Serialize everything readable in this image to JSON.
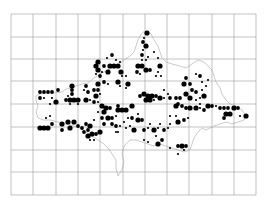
{
  "map": {
    "width": 266,
    "height": 211,
    "grid": {
      "x_lines": [
        11,
        33,
        56,
        78,
        100,
        123,
        145,
        167,
        189,
        212,
        234,
        256
      ],
      "y_lines": [
        14,
        37,
        59,
        81,
        104,
        127,
        150,
        172,
        195
      ],
      "color": "#9a9a9a"
    },
    "outline_color": "#a8a8a8",
    "dot_color": "#000000",
    "dot_sizes": {
      "L": 2.6,
      "M": 1.9,
      "S": 1.1
    },
    "outline_path": "M36,96 L40,94 L46,93 L54,93 L62,92 L66,89 L72,88 L76,86 L82,84 L88,83 L94,78 L100,74 L104,72 L108,70 L112,68 L118,65 L124,60 L130,56 L134,52 L136,46 L138,40 L140,36 L143,32 L147,31 L151,34 L154,40 L158,46 L160,52 L162,58 L166,62 L172,64 L180,66 L186,68 L192,64 L198,60 L204,62 L208,66 L212,70 L214,76 L216,82 L220,88 L222,94 L226,100 L230,104 L236,106 L242,110 L246,116 L244,120 L238,122 L232,124 L226,122 L220,124 L214,126 L210,128 L206,130 L202,128 L198,132 L194,138 L192,144 L190,150 L184,152 L178,150 L172,148 L166,146 L160,144 L154,146 L148,144 L142,142 L136,140 L130,140 L124,146 L122,154 L124,162 L122,170 L118,176 L116,168 L116,160 L112,154 L108,148 L104,144 L98,140 L92,136 L86,132 L80,128 L74,126 L66,124 L58,122 L50,120 L44,120 L38,118 L36,112 L38,106 L36,100 Z",
    "dots": [
      [
        147,
        33,
        "L"
      ],
      [
        144,
        38,
        "S"
      ],
      [
        143,
        42,
        "M"
      ],
      [
        146,
        46,
        "L"
      ],
      [
        143,
        50,
        "S"
      ],
      [
        154,
        52,
        "S"
      ],
      [
        142,
        55,
        "M"
      ],
      [
        142,
        60,
        "S"
      ],
      [
        146,
        60,
        "S"
      ],
      [
        148,
        57,
        "S"
      ],
      [
        158,
        58,
        "S"
      ],
      [
        138,
        66,
        "L"
      ],
      [
        142,
        66,
        "L"
      ],
      [
        146,
        70,
        "L"
      ],
      [
        150,
        70,
        "M"
      ],
      [
        137,
        72,
        "M"
      ],
      [
        140,
        74,
        "S"
      ],
      [
        160,
        66,
        "L"
      ],
      [
        158,
        72,
        "S"
      ],
      [
        156,
        76,
        "S"
      ],
      [
        161,
        76,
        "S"
      ],
      [
        98,
        62,
        "L"
      ],
      [
        96,
        66,
        "L"
      ],
      [
        104,
        66,
        "M"
      ],
      [
        110,
        66,
        "L"
      ],
      [
        114,
        66,
        "L"
      ],
      [
        118,
        66,
        "L"
      ],
      [
        108,
        72,
        "L"
      ],
      [
        98,
        70,
        "L"
      ],
      [
        102,
        72,
        "S"
      ],
      [
        100,
        76,
        "M"
      ],
      [
        96,
        74,
        "S"
      ],
      [
        112,
        55,
        "M"
      ],
      [
        107,
        58,
        "S"
      ],
      [
        116,
        60,
        "S"
      ],
      [
        120,
        62,
        "S"
      ],
      [
        121,
        72,
        "L"
      ],
      [
        122,
        76,
        "S"
      ],
      [
        126,
        76,
        "S"
      ],
      [
        40,
        92,
        "M"
      ],
      [
        44,
        92,
        "M"
      ],
      [
        48,
        92,
        "M"
      ],
      [
        52,
        92,
        "M"
      ],
      [
        58,
        90,
        "M"
      ],
      [
        40,
        98,
        "M"
      ],
      [
        44,
        98,
        "S"
      ],
      [
        52,
        98,
        "S"
      ],
      [
        56,
        102,
        "L"
      ],
      [
        50,
        104,
        "S"
      ],
      [
        72,
        86,
        "L"
      ],
      [
        72,
        90,
        "M"
      ],
      [
        72,
        94,
        "M"
      ],
      [
        68,
        96,
        "S"
      ],
      [
        66,
        100,
        "M"
      ],
      [
        70,
        100,
        "L"
      ],
      [
        74,
        100,
        "L"
      ],
      [
        78,
        100,
        "L"
      ],
      [
        70,
        104,
        "S"
      ],
      [
        78,
        104,
        "S"
      ],
      [
        86,
        86,
        "M"
      ],
      [
        84,
        90,
        "S"
      ],
      [
        88,
        92,
        "M"
      ],
      [
        94,
        90,
        "M"
      ],
      [
        98,
        90,
        "M"
      ],
      [
        98,
        84,
        "L"
      ],
      [
        96,
        96,
        "L"
      ],
      [
        100,
        94,
        "S"
      ],
      [
        86,
        100,
        "L"
      ],
      [
        90,
        100,
        "S"
      ],
      [
        94,
        102,
        "M"
      ],
      [
        98,
        102,
        "S"
      ],
      [
        104,
        82,
        "M"
      ],
      [
        108,
        84,
        "S"
      ],
      [
        118,
        82,
        "L"
      ],
      [
        120,
        86,
        "S"
      ],
      [
        128,
        84,
        "L"
      ],
      [
        126,
        88,
        "S"
      ],
      [
        144,
        94,
        "L"
      ],
      [
        148,
        96,
        "L"
      ],
      [
        152,
        96,
        "L"
      ],
      [
        156,
        96,
        "M"
      ],
      [
        140,
        96,
        "M"
      ],
      [
        146,
        100,
        "L"
      ],
      [
        150,
        100,
        "L"
      ],
      [
        154,
        100,
        "S"
      ],
      [
        160,
        98,
        "L"
      ],
      [
        164,
        98,
        "S"
      ],
      [
        164,
        90,
        "S"
      ],
      [
        168,
        94,
        "S"
      ],
      [
        170,
        98,
        "M"
      ],
      [
        176,
        98,
        "M"
      ],
      [
        180,
        98,
        "M"
      ],
      [
        178,
        104,
        "M"
      ],
      [
        186,
        78,
        "M"
      ],
      [
        184,
        84,
        "L"
      ],
      [
        190,
        84,
        "M"
      ],
      [
        192,
        90,
        "M"
      ],
      [
        196,
        92,
        "M"
      ],
      [
        186,
        94,
        "L"
      ],
      [
        190,
        98,
        "L"
      ],
      [
        196,
        100,
        "S"
      ],
      [
        200,
        98,
        "S"
      ],
      [
        204,
        96,
        "L"
      ],
      [
        202,
        90,
        "S"
      ],
      [
        208,
        80,
        "S"
      ],
      [
        206,
        86,
        "S"
      ],
      [
        196,
        74,
        "S"
      ],
      [
        200,
        76,
        "M"
      ],
      [
        202,
        82,
        "S"
      ],
      [
        200,
        104,
        "S"
      ],
      [
        40,
        128,
        "L"
      ],
      [
        44,
        128,
        "L"
      ],
      [
        48,
        128,
        "L"
      ],
      [
        52,
        124,
        "M"
      ],
      [
        50,
        116,
        "S"
      ],
      [
        46,
        118,
        "S"
      ],
      [
        62,
        124,
        "L"
      ],
      [
        62,
        130,
        "M"
      ],
      [
        68,
        122,
        "L"
      ],
      [
        70,
        128,
        "L"
      ],
      [
        74,
        122,
        "L"
      ],
      [
        78,
        126,
        "M"
      ],
      [
        82,
        128,
        "M"
      ],
      [
        86,
        124,
        "M"
      ],
      [
        84,
        132,
        "M"
      ],
      [
        88,
        130,
        "M"
      ],
      [
        90,
        126,
        "L"
      ],
      [
        88,
        136,
        "L"
      ],
      [
        92,
        134,
        "L"
      ],
      [
        96,
        134,
        "M"
      ],
      [
        100,
        132,
        "L"
      ],
      [
        90,
        140,
        "S"
      ],
      [
        94,
        140,
        "S"
      ],
      [
        94,
        120,
        "S"
      ],
      [
        102,
        106,
        "L"
      ],
      [
        106,
        108,
        "L"
      ],
      [
        110,
        108,
        "M"
      ],
      [
        104,
        112,
        "L"
      ],
      [
        102,
        118,
        "M"
      ],
      [
        108,
        118,
        "L"
      ],
      [
        112,
        118,
        "M"
      ],
      [
        116,
        116,
        "S"
      ],
      [
        98,
        112,
        "S"
      ],
      [
        118,
        106,
        "M"
      ],
      [
        118,
        110,
        "L"
      ],
      [
        122,
        110,
        "L"
      ],
      [
        126,
        110,
        "L"
      ],
      [
        132,
        106,
        "L"
      ],
      [
        128,
        118,
        "S"
      ],
      [
        132,
        118,
        "M"
      ],
      [
        138,
        114,
        "S"
      ],
      [
        138,
        120,
        "L"
      ],
      [
        142,
        120,
        "M"
      ],
      [
        104,
        124,
        "M"
      ],
      [
        112,
        124,
        "M"
      ],
      [
        116,
        126,
        "M"
      ],
      [
        120,
        126,
        "S"
      ],
      [
        124,
        122,
        "S"
      ],
      [
        126,
        128,
        "S"
      ],
      [
        130,
        126,
        "S"
      ],
      [
        116,
        132,
        "S"
      ],
      [
        118,
        132,
        "S"
      ],
      [
        134,
        130,
        "L"
      ],
      [
        144,
        130,
        "M"
      ],
      [
        148,
        128,
        "S"
      ],
      [
        150,
        124,
        "S"
      ],
      [
        154,
        130,
        "L"
      ],
      [
        158,
        128,
        "S"
      ],
      [
        160,
        124,
        "S"
      ],
      [
        164,
        130,
        "M"
      ],
      [
        168,
        128,
        "S"
      ],
      [
        170,
        124,
        "S"
      ],
      [
        176,
        106,
        "L"
      ],
      [
        182,
        106,
        "M"
      ],
      [
        186,
        108,
        "M"
      ],
      [
        190,
        108,
        "L"
      ],
      [
        196,
        108,
        "L"
      ],
      [
        200,
        108,
        "S"
      ],
      [
        204,
        110,
        "M"
      ],
      [
        208,
        106,
        "L"
      ],
      [
        212,
        106,
        "M"
      ],
      [
        216,
        106,
        "S"
      ],
      [
        220,
        108,
        "M"
      ],
      [
        224,
        108,
        "M"
      ],
      [
        228,
        108,
        "M"
      ],
      [
        234,
        108,
        "L"
      ],
      [
        238,
        108,
        "M"
      ],
      [
        226,
        114,
        "L"
      ],
      [
        230,
        114,
        "L"
      ],
      [
        224,
        118,
        "M"
      ],
      [
        246,
        116,
        "L"
      ],
      [
        240,
        116,
        "S"
      ],
      [
        170,
        116,
        "S"
      ],
      [
        176,
        116,
        "S"
      ],
      [
        178,
        122,
        "L"
      ],
      [
        184,
        120,
        "M"
      ],
      [
        188,
        118,
        "S"
      ],
      [
        156,
        136,
        "S"
      ],
      [
        162,
        140,
        "M"
      ],
      [
        158,
        144,
        "L"
      ],
      [
        170,
        148,
        "S"
      ],
      [
        178,
        146,
        "M"
      ],
      [
        182,
        146,
        "L"
      ],
      [
        186,
        146,
        "M"
      ],
      [
        184,
        150,
        "S"
      ],
      [
        178,
        154,
        "S"
      ],
      [
        144,
        140,
        "S"
      ],
      [
        148,
        142,
        "S"
      ]
    ]
  }
}
